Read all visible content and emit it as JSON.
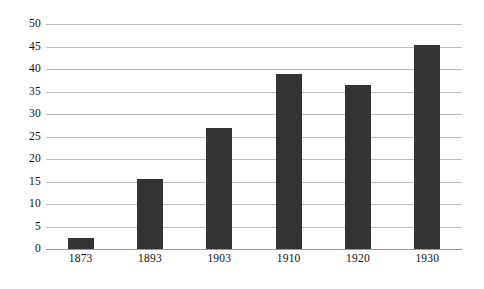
{
  "chart_data": {
    "type": "bar",
    "title": "",
    "subtitle": "",
    "xlabel": "",
    "ylabel": "",
    "categories": [
      "1873",
      "1893",
      "1903",
      "1910",
      "1920",
      "1930"
    ],
    "values": [
      2.5,
      15.5,
      27.0,
      39.0,
      36.5,
      45.3
    ],
    "series": [
      {
        "name": "",
        "values": [
          2.5,
          15.5,
          27.0,
          39.0,
          36.5,
          45.3
        ]
      }
    ],
    "ylim": [
      0,
      50
    ],
    "ytick_labels": [
      "0",
      "5",
      "10",
      "15",
      "20",
      "25",
      "30",
      "35",
      "40",
      "45",
      "50"
    ],
    "ytick_values": [
      0,
      5,
      10,
      15,
      20,
      25,
      30,
      35,
      40,
      45,
      50
    ],
    "xtick_labels": [
      "1873",
      "1893",
      "1903",
      "1910",
      "1920",
      "1930"
    ],
    "grid": true,
    "grid_axis": "y",
    "legend": false,
    "legend_position": "none",
    "annotations": [],
    "colors": {
      "bar": "#333333",
      "gridline": "#bdbdbd",
      "baseline": "#9a9a9a",
      "background": "#ffffff",
      "text": "#111111"
    }
  }
}
